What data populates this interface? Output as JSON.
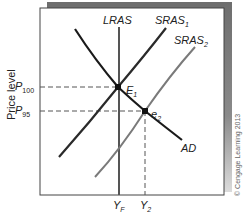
{
  "diagram": {
    "type": "aggregate-supply-demand",
    "y_axis_label": "Price level",
    "credit": "© Cengage Learning 2013",
    "curves": [
      {
        "id": "LRAS",
        "label": "LRAS",
        "sub": "",
        "color": "#555555"
      },
      {
        "id": "SRAS1",
        "label": "SRAS",
        "sub": "1",
        "color": "#2a2a2a"
      },
      {
        "id": "SRAS2",
        "label": "SRAS",
        "sub": "2",
        "color": "#7a7a7a"
      },
      {
        "id": "AD",
        "label": "AD",
        "sub": "",
        "color": "#1a1a1a"
      }
    ],
    "points": [
      {
        "id": "E1",
        "label": "E",
        "sub": "1"
      },
      {
        "id": "e2",
        "label": "e",
        "sub": "2"
      }
    ],
    "price_ticks": [
      {
        "label": "P",
        "sub": "100"
      },
      {
        "label": "P",
        "sub": "95"
      }
    ],
    "output_ticks": [
      {
        "label": "Y",
        "sub": "F"
      },
      {
        "label": "Y",
        "sub": "2"
      }
    ],
    "frame": {
      "shadow_color": "#6e6e6e",
      "border_color": "#444444"
    }
  }
}
